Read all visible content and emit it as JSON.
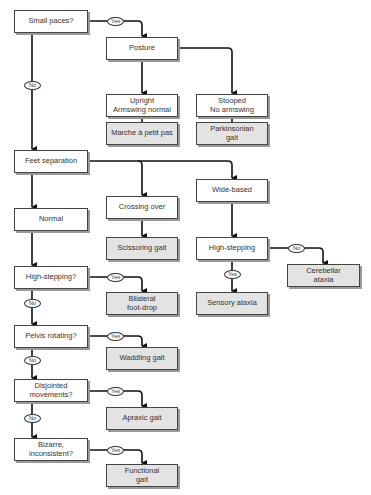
{
  "labels": {
    "yes": "Yes",
    "no": "No"
  },
  "nodes": {
    "small_paces": "Small paces?",
    "posture": "Posture",
    "upright": "Upright\nArmswing normal",
    "stooped": "Stooped\nNo armswing",
    "marche": "Marche à petit pas",
    "parkinsonian": "Parkinsonian\ngait",
    "feet_separation": "Feet separation",
    "crossing_over": "Crossing over",
    "wide_based": "Wide-based",
    "normal": "Normal",
    "scissoring": "Scissoring gait",
    "high_stepping_right": "High-stepping",
    "cerebellar": "Cerebellar\nataxia",
    "sensory": "Sensory ataxia",
    "high_stepping_q": "High-stepping?",
    "foot_drop": "Bilateral\nfoot-drop",
    "pelvis": "Pelvis rotating?",
    "waddling": "Waddling gait",
    "disjointed": "Disjointed\nmovements?",
    "apraxic": "Apraxic gait",
    "bizarre": "Bizarre,\ninconsistent?",
    "functional": "Functional\ngait"
  },
  "colors": {
    "outcome_fill": "#e3e3e3",
    "box_border": "#444444",
    "line": "#111111"
  }
}
